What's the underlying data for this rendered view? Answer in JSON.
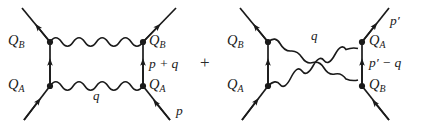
{
  "figure": {
    "type": "feynman-diagram-pair",
    "operator": "+",
    "line_color": "#1a1a1a",
    "background": "#ffffff"
  },
  "diagram_left": {
    "name": "direct-exchange-diagram",
    "labels": {
      "charge_top_left": {
        "base": "Q",
        "sub": "B"
      },
      "charge_top_right": {
        "base": "Q",
        "sub": "B"
      },
      "charge_bottom_left": {
        "base": "Q",
        "sub": "A"
      },
      "charge_bottom_right": {
        "base": "Q",
        "sub": "A"
      },
      "internal_fermion_momentum": "p + q",
      "photon_momentum": "q",
      "incoming_momentum": "p"
    }
  },
  "diagram_right": {
    "name": "crossed-exchange-diagram",
    "labels": {
      "charge_top_left": {
        "base": "Q",
        "sub": "B"
      },
      "charge_top_right": {
        "base": "Q",
        "sub": "A"
      },
      "charge_bottom_left": {
        "base": "Q",
        "sub": "A"
      },
      "charge_bottom_right": {
        "base": "Q",
        "sub": "B"
      },
      "outgoing_momentum": "p′",
      "internal_fermion_momentum": "p′ − q",
      "photon_momentum": "q"
    }
  }
}
